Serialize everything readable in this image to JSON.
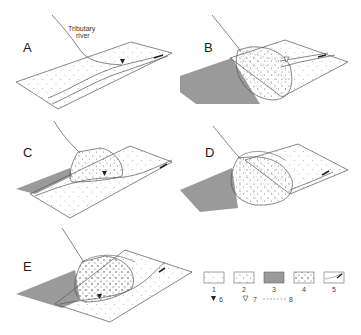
{
  "panels": [
    {
      "label": "A",
      "annotation": "Tributary river"
    },
    {
      "label": "B"
    },
    {
      "label": "C"
    },
    {
      "label": "D"
    },
    {
      "label": "E"
    }
  ],
  "annotations": {
    "tributary_line1": "Tributary",
    "tributary_line2": "river"
  },
  "legend": {
    "items": [
      {
        "key": "1",
        "symbol": "fine-dotted-box"
      },
      {
        "key": "2",
        "symbol": "coarse-dotted-box"
      },
      {
        "key": "3",
        "symbol": "gray-filled-box"
      },
      {
        "key": "4",
        "symbol": "bold-dotted-box"
      },
      {
        "key": "5",
        "symbol": "channel-arrow-box"
      },
      {
        "key": "6",
        "symbol": "filled-triangle"
      },
      {
        "key": "7",
        "symbol": "open-triangle"
      },
      {
        "key": "8",
        "symbol": "dashed-line"
      }
    ]
  },
  "colors": {
    "line": "#555555",
    "shade": "#9a9a9a",
    "dot": "#777777"
  }
}
